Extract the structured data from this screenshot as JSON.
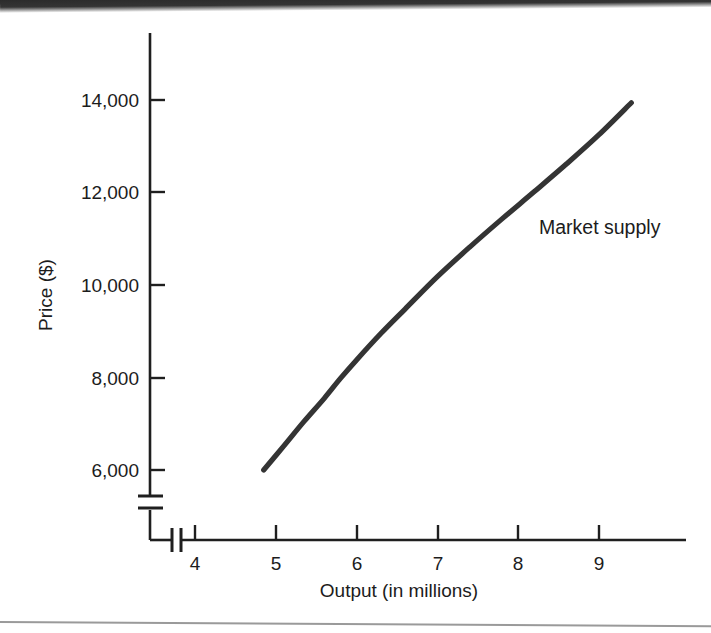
{
  "chart_data": {
    "type": "line",
    "title": "",
    "xlabel": "Output (in millions)",
    "ylabel": "Price ($)",
    "xlim": [
      3.5,
      9.55
    ],
    "ylim": [
      5000,
      15200
    ],
    "grid": false,
    "legend_position": "inline-right",
    "x_ticks": [
      "4",
      "5",
      "6",
      "7",
      "8",
      "9"
    ],
    "x_tick_values": [
      4,
      5,
      6,
      7,
      8,
      9
    ],
    "y_ticks": [
      "6,000",
      "8,000",
      "10,000",
      "12,000",
      "14,000"
    ],
    "y_tick_values": [
      6000,
      8000,
      10000,
      12000,
      14000
    ],
    "axis_break_x": true,
    "axis_break_y": true,
    "series": [
      {
        "name": "Market supply",
        "color": "#343434",
        "x": [
          4.85,
          5.1,
          5.35,
          5.6,
          5.8,
          6.0,
          6.3,
          6.6,
          7.0,
          7.4,
          7.8,
          8.2,
          8.6,
          9.0,
          9.4
        ],
        "values": [
          6000,
          6520,
          7050,
          7550,
          7980,
          8380,
          8950,
          9480,
          10180,
          10820,
          11430,
          12020,
          12620,
          13250,
          13940
        ]
      }
    ],
    "annotations": [
      {
        "text": "Market supply",
        "x": 7.8,
        "y": 11450
      }
    ]
  },
  "figure": {
    "background_color": "#ffffff",
    "ink_color": "#1c1c1c",
    "curve_color": "#343434"
  }
}
